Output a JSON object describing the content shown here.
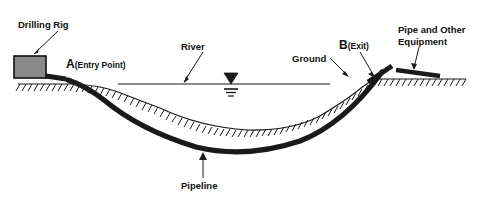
{
  "figure": {
    "title_alt": "Horizontal directional drilling river crossing diagram",
    "background_color": "#ffffff",
    "ink_color": "#1a1a1a",
    "rig_fill_color": "#8a8a8a"
  },
  "labels": {
    "drilling_rig": "Drilling Rig",
    "entry_point_letter": "A",
    "entry_point_paren": "(Entry Point)",
    "river": "River",
    "ground": "Ground",
    "exit_point_letter": "B",
    "exit_point_paren": "(Exit)",
    "pipe_equipment_line1": "Pipe and Other",
    "pipe_equipment_line2": "Equipment",
    "pipeline": "Pipeline"
  },
  "elements": {
    "drilling_rig_box": "gray filled rectangle on left bank",
    "water_level_symbol": "inverted filled triangle over three stacked horizontal bars",
    "hatched_ground": "ground surface with diagonal hatch ticks below",
    "pipeline_curve": "thick bored pipeline arc passing beneath riverbed",
    "pipe_stub": "thick diagonal pipe segment at exit point",
    "equipment_bar": "thick horizontal bar right of exit point"
  },
  "geometry": {
    "width": 487,
    "height": 197,
    "ground_left_y": 84,
    "ground_right_y": 79,
    "water_surface_y": 84,
    "entry_point_x": 72,
    "entry_point_y": 84,
    "exit_point_x": 374,
    "exit_point_y": 79,
    "pipeline_lowest_y": 150
  }
}
